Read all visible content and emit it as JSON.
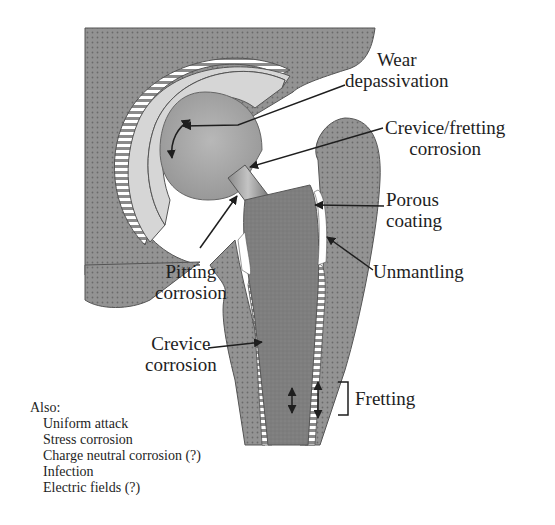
{
  "figure": {
    "labels": {
      "wear_depassivation": [
        "Wear",
        "depassivation"
      ],
      "crevice_fretting_corrosion": [
        "Crevice/fretting",
        "corrosion"
      ],
      "porous_coating": [
        "Porous",
        "coating"
      ],
      "unmantling": "Unmantling",
      "pitting_corrosion": [
        "Pitting",
        "corrosion"
      ],
      "crevice_corrosion": [
        "Crevice",
        "corrosion"
      ],
      "fretting": "Fretting"
    },
    "also": {
      "heading": "Also:",
      "items": [
        "Uniform attack",
        "Stress corrosion",
        "Charge neutral corrosion (?)",
        "Infection",
        "Electric fields (?)"
      ]
    },
    "colors": {
      "bone": "#8f8f8f",
      "bone_dots": "#6e6e6e",
      "stem": "#7d7d7d",
      "cup_liner": "#d4d4d4",
      "head": "#a8a8a8",
      "line": "#1e1e1e",
      "background": "#ffffff"
    }
  }
}
